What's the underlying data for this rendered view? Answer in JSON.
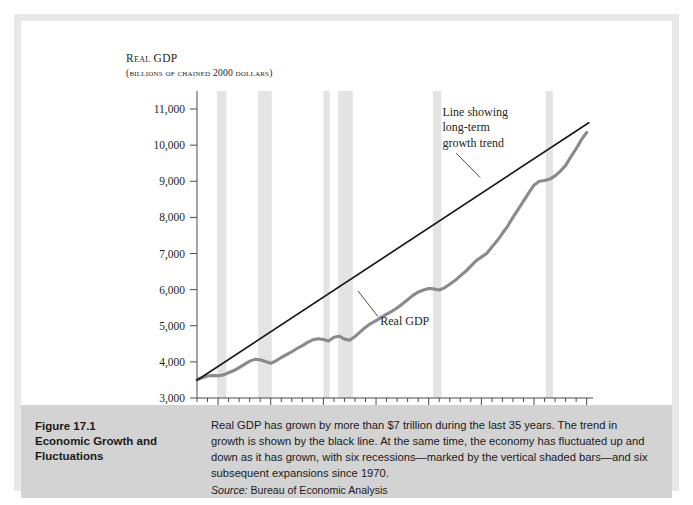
{
  "figure": {
    "number": "Figure 17.1",
    "title_line1": "Economic Growth and",
    "title_line2": "Fluctuations",
    "caption": "Real GDP has grown by more than $7 trillion during the last 35 years. The trend in growth is shown by the black line. At the same time, the economy has fluctuated up and down as it has grown, with six recessions—marked by the vertical shaded bars—and six subsequent expansions since 1970.",
    "source_label": "Source:",
    "source_text": " Bureau of Economic Analysis"
  },
  "chart_data": {
    "type": "line",
    "title": "",
    "ylabel_main": "Real GDP",
    "ylabel_sub": "(billions of chained 2000 dollars)",
    "xlabel": "",
    "xlim": [
      1968,
      2005.6
    ],
    "ylim": [
      3000,
      11000
    ],
    "grid": false,
    "legend_position": "none",
    "yticks": [
      3000,
      4000,
      5000,
      6000,
      7000,
      8000,
      9000,
      10000,
      11000
    ],
    "ytick_labels": [
      "3,000",
      "4,000",
      "5,000",
      "6,000",
      "7,000",
      "8,000",
      "9,000",
      "10,000",
      "11,000"
    ],
    "xticks": [
      1970,
      1975,
      1980,
      1985,
      1990,
      1995,
      2000,
      2005
    ],
    "xtick_labels": [
      "1970",
      "1975",
      "1980",
      "1985",
      "1990",
      "1995",
      "2000",
      "2005"
    ],
    "xminor_step": 1,
    "series": [
      {
        "name": "Real GDP",
        "color": "#8a8a8a",
        "width": 3.1,
        "x": [
          1968,
          1968.5,
          1969,
          1969.5,
          1970,
          1970.5,
          1971,
          1971.5,
          1972,
          1972.5,
          1973,
          1973.5,
          1974,
          1974.5,
          1975,
          1975.5,
          1976,
          1976.5,
          1977,
          1977.5,
          1978,
          1978.5,
          1979,
          1979.5,
          1980,
          1980.5,
          1981,
          1981.5,
          1982,
          1982.5,
          1983,
          1983.5,
          1984,
          1984.5,
          1985,
          1985.5,
          1986,
          1986.5,
          1987,
          1987.5,
          1988,
          1988.5,
          1989,
          1989.5,
          1990,
          1990.5,
          1991,
          1991.5,
          1992,
          1992.5,
          1993,
          1993.5,
          1994,
          1994.5,
          1995,
          1995.5,
          1996,
          1996.5,
          1997,
          1997.5,
          1998,
          1998.5,
          1999,
          1999.5,
          2000,
          2000.5,
          2001,
          2001.5,
          2002,
          2002.5,
          2003,
          2003.5,
          2004,
          2004.5,
          2005
        ],
        "y": [
          3510,
          3560,
          3610,
          3625,
          3615,
          3640,
          3700,
          3760,
          3840,
          3930,
          4020,
          4070,
          4060,
          4010,
          3960,
          4030,
          4120,
          4200,
          4280,
          4370,
          4450,
          4540,
          4610,
          4640,
          4620,
          4580,
          4680,
          4710,
          4630,
          4600,
          4700,
          4830,
          4960,
          5060,
          5140,
          5230,
          5320,
          5400,
          5490,
          5600,
          5720,
          5840,
          5930,
          5990,
          6030,
          6020,
          5990,
          6050,
          6150,
          6250,
          6380,
          6500,
          6650,
          6800,
          6900,
          7000,
          7180,
          7350,
          7560,
          7760,
          8000,
          8220,
          8450,
          8680,
          8890,
          9000,
          9020,
          9060,
          9150,
          9280,
          9440,
          9680,
          9900,
          10150,
          10350
        ]
      },
      {
        "name": "Line showing long-term growth trend",
        "color": "#1a1a1a",
        "width": 1.7,
        "x": [
          1968,
          2005.2
        ],
        "y": [
          3490,
          10620
        ]
      }
    ],
    "recession_bars": {
      "color": "#e4e4e4",
      "spans": [
        [
          1969.9,
          1970.8
        ],
        [
          1973.8,
          1975.1
        ],
        [
          1980.0,
          1980.6
        ],
        [
          1981.4,
          1982.8
        ],
        [
          1990.4,
          1991.2
        ],
        [
          2001.1,
          2001.8
        ]
      ]
    },
    "annotations": [
      {
        "name": "trend-annotation",
        "lines": [
          "Line showing",
          "long-term",
          "growth trend"
        ],
        "text_x": 1991.3,
        "text_y": 10820,
        "leader": {
          "x1": 1992.6,
          "y1": 9780,
          "x2": 1994.9,
          "y2": 9100
        }
      },
      {
        "name": "real-gdp-annotation",
        "lines": [
          "Real GDP"
        ],
        "text_x": 1985.4,
        "text_y": 5010,
        "leader": {
          "x1": 1985.2,
          "y1": 5250,
          "x2": 1983.3,
          "y2": 5960
        }
      }
    ]
  }
}
